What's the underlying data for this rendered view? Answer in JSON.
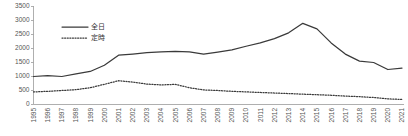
{
  "chart_data": {
    "type": "line",
    "title": "",
    "xlabel": "",
    "ylabel": "",
    "ylim": [
      0,
      3500
    ],
    "ytick_step": 500,
    "yticks": [
      0,
      500,
      1000,
      1500,
      2000,
      2500,
      3000,
      3500
    ],
    "grid": false,
    "legend_position": "top-center",
    "categories": [
      "1995",
      "1996",
      "1997",
      "1998",
      "1999",
      "2000",
      "2001",
      "2002",
      "2003",
      "2004",
      "2005",
      "2006",
      "2007",
      "2008",
      "2009",
      "2010",
      "2011",
      "2012",
      "2013",
      "2014",
      "2015",
      "2016",
      "2017",
      "2018",
      "2019",
      "2020",
      "2021"
    ],
    "series": [
      {
        "name": "全日",
        "style": "solid",
        "color": "#3a3a3a",
        "values": [
          1000,
          1030,
          1000,
          1090,
          1180,
          1400,
          1760,
          1800,
          1850,
          1880,
          1900,
          1880,
          1800,
          1870,
          1950,
          2080,
          2200,
          2350,
          2560,
          2900,
          2700,
          2200,
          1800,
          1550,
          1500,
          1250,
          1300
        ]
      },
      {
        "name": "定時",
        "style": "dotted",
        "color": "#3a3a3a",
        "values": [
          450,
          470,
          500,
          530,
          600,
          720,
          850,
          800,
          730,
          700,
          720,
          600,
          520,
          500,
          470,
          450,
          430,
          410,
          390,
          370,
          350,
          330,
          300,
          280,
          250,
          200,
          180
        ]
      }
    ]
  },
  "legend": {
    "items": [
      {
        "label": "全日",
        "style": "solid"
      },
      {
        "label": "定時",
        "style": "dotted"
      }
    ]
  }
}
